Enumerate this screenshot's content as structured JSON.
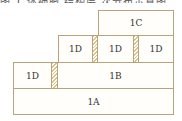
{
  "caption_fragment": "图 1 体细胞 结构层 次分布示意图",
  "diagram": {
    "colors": {
      "border": "#b9a37a",
      "hatch": "#d8c28a",
      "fill": "#fffefb"
    },
    "row_4": {
      "labels": [
        "1C"
      ]
    },
    "row_3": {
      "labels": [
        "1D",
        "1D",
        "1D"
      ]
    },
    "row_2": {
      "labels": [
        "1D",
        "1B"
      ]
    },
    "row_1": {
      "labels": [
        "1A"
      ]
    }
  }
}
